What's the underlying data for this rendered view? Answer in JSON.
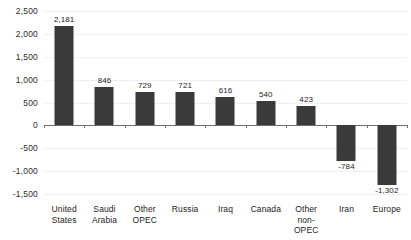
{
  "chart_data": {
    "type": "bar",
    "title": "",
    "subtitle": "",
    "xlabel": "",
    "ylabel": "",
    "categories": [
      "United States",
      "Saudi Arabia",
      "Other OPEC",
      "Russia",
      "Iraq",
      "Canada",
      "Other non-OPEC",
      "Iran",
      "Europe"
    ],
    "category_lines": [
      [
        "United",
        "States"
      ],
      [
        "Saudi",
        "Arabia"
      ],
      [
        "Other",
        "OPEC"
      ],
      [
        "Russia"
      ],
      [
        "Iraq"
      ],
      [
        "Canada"
      ],
      [
        "Other",
        "non-OPEC"
      ],
      [
        "Iran"
      ],
      [
        "Europe"
      ]
    ],
    "values": [
      2181,
      846,
      729,
      721,
      616,
      540,
      423,
      -784,
      -1302
    ],
    "value_labels": [
      "2,181",
      "846",
      "729",
      "721",
      "616",
      "540",
      "423",
      "-784",
      "-1,302"
    ],
    "ylim": [
      -1500,
      2500
    ],
    "ytick_values": [
      2500,
      2000,
      1500,
      1000,
      500,
      0,
      -500,
      -1000,
      -1500
    ],
    "ytick_labels": [
      "2,500",
      "2,000",
      "1,500",
      "1,000",
      "500",
      "0",
      "-500",
      "-1,000",
      "-1,500"
    ],
    "grid": true,
    "legend": "none",
    "bar_color": "#3a3a3a",
    "gridline_color": "#f0f0f0",
    "axis_color": "#6e6e6e",
    "background_color": "#ffffff"
  }
}
